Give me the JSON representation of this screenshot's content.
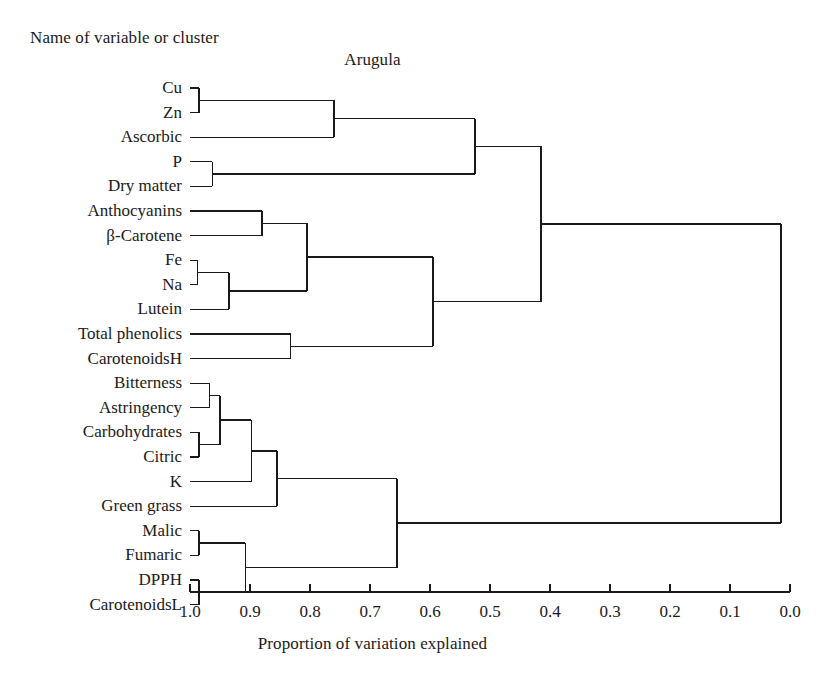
{
  "header": {
    "note": "Name of variable or cluster",
    "title": "Arugula"
  },
  "axis": {
    "title": "Proportion of variation explained",
    "ticks": [
      "1.0",
      "0.9",
      "0.8",
      "0.7",
      "0.6",
      "0.5",
      "0.4",
      "0.3",
      "0.2",
      "0.1",
      "0.0"
    ],
    "min": 0.0,
    "max": 1.0,
    "direction": "reversed"
  },
  "leaves": [
    {
      "label": "Cu"
    },
    {
      "label": "Zn"
    },
    {
      "label": "Ascorbic"
    },
    {
      "label": "P"
    },
    {
      "label": "Dry matter"
    },
    {
      "label": "Anthocyanins"
    },
    {
      "label": "β-Carotene"
    },
    {
      "label": "Fe"
    },
    {
      "label": "Na"
    },
    {
      "label": "Lutein"
    },
    {
      "label": "Total phenolics"
    },
    {
      "label": "CarotenoidsH"
    },
    {
      "label": "Bitterness"
    },
    {
      "label": "Astringency"
    },
    {
      "label": "Carbohydrates"
    },
    {
      "label": "Citric"
    },
    {
      "label": "K"
    },
    {
      "label": "Green grass"
    },
    {
      "label": "Malic"
    },
    {
      "label": "Fumaric"
    },
    {
      "label": "DPPH"
    },
    {
      "label": "CarotenoidsL"
    }
  ],
  "chart_data": {
    "type": "dendrogram",
    "title": "Arugula",
    "xlabel": "Proportion of variation explained",
    "ylabel": "Name of variable or cluster",
    "xlim": [
      1.0,
      0.0
    ],
    "x_axis_reversed": true,
    "grid": false,
    "legend": null,
    "leaf_order": [
      "Cu",
      "Zn",
      "Ascorbic",
      "P",
      "Dry matter",
      "Anthocyanins",
      "β-Carotene",
      "Fe",
      "Na",
      "Lutein",
      "Total phenolics",
      "CarotenoidsH",
      "Bitterness",
      "Astringency",
      "Carbohydrates",
      "Citric",
      "K",
      "Green grass",
      "Malic",
      "Fumaric",
      "DPPH",
      "CarotenoidsL"
    ],
    "merges": [
      {
        "id": "m1",
        "children": [
          "Cu",
          "Zn"
        ],
        "height": 0.985
      },
      {
        "id": "m2",
        "children": [
          "m1",
          "Ascorbic"
        ],
        "height": 0.76
      },
      {
        "id": "m3",
        "children": [
          "P",
          "Dry matter"
        ],
        "height": 0.963
      },
      {
        "id": "m4",
        "children": [
          "m2",
          "m3"
        ],
        "height": 0.525
      },
      {
        "id": "m5",
        "children": [
          "Anthocyanins",
          "β-Carotene"
        ],
        "height": 0.88
      },
      {
        "id": "m6",
        "children": [
          "Fe",
          "Na"
        ],
        "height": 0.988
      },
      {
        "id": "m7",
        "children": [
          "m6",
          "Lutein"
        ],
        "height": 0.935
      },
      {
        "id": "m8",
        "children": [
          "m5",
          "m7"
        ],
        "height": 0.805
      },
      {
        "id": "m9",
        "children": [
          "Total phenolics",
          "CarotenoidsH"
        ],
        "height": 0.832
      },
      {
        "id": "m10",
        "children": [
          "m8",
          "m9"
        ],
        "height": 0.595
      },
      {
        "id": "m11",
        "children": [
          "m4",
          "m10"
        ],
        "height": 0.415
      },
      {
        "id": "m12",
        "children": [
          "Bitterness",
          "Astringency"
        ],
        "height": 0.967
      },
      {
        "id": "m13",
        "children": [
          "Carbohydrates",
          "Citric"
        ],
        "height": 0.985
      },
      {
        "id": "m14",
        "children": [
          "m12",
          "m13"
        ],
        "height": 0.95
      },
      {
        "id": "m15",
        "children": [
          "m14",
          "K"
        ],
        "height": 0.898
      },
      {
        "id": "m16",
        "children": [
          "m15",
          "Green grass"
        ],
        "height": 0.855
      },
      {
        "id": "m17",
        "children": [
          "Malic",
          "Fumaric"
        ],
        "height": 0.985
      },
      {
        "id": "m18",
        "children": [
          "DPPH",
          "CarotenoidsL"
        ],
        "height": 0.985
      },
      {
        "id": "m19",
        "children": [
          "m17",
          "m18"
        ],
        "height": 0.908
      },
      {
        "id": "m20",
        "children": [
          "m16",
          "m19"
        ],
        "height": 0.655
      },
      {
        "id": "m21",
        "children": [
          "m11",
          "m20"
        ],
        "height": 0.015
      }
    ]
  }
}
